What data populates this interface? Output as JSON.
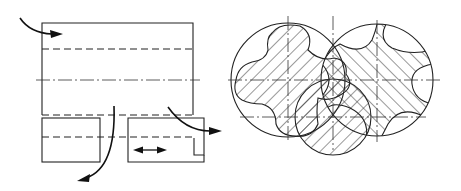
{
  "figure": {
    "left_view": {
      "name": "side-section-view",
      "arrows": [
        "inlet-flow-arrow",
        "outlet-flow-arrow-down",
        "outlet-flow-arrow-right",
        "slide-valve-double-arrow"
      ]
    },
    "right_view": {
      "name": "rotor-cross-section",
      "rotors": [
        "male-rotor",
        "female-rotor",
        "lower-rotor"
      ]
    },
    "colors": {
      "line": "#222222",
      "hatch": "#333333",
      "background": "#ffffff"
    }
  }
}
